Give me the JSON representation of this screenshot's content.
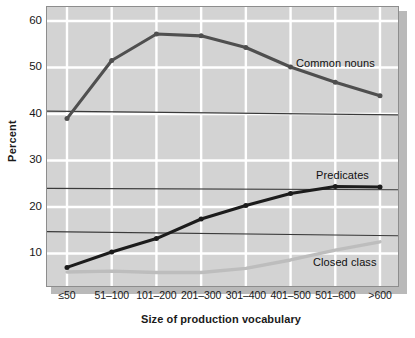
{
  "chart_data": {
    "type": "line",
    "title": "",
    "xlabel": "Size of production vocabulary",
    "ylabel": "Percent",
    "categories": [
      "≤50",
      "51–100",
      "101–200",
      "201–300",
      "301–400",
      "401–500",
      "501–600",
      ">600"
    ],
    "ylim": [
      3,
      63
    ],
    "yticks": [
      10,
      20,
      30,
      40,
      50,
      60
    ],
    "ytick_labels": [
      "10",
      "20",
      "30",
      "40",
      "50",
      "60"
    ],
    "grid": true,
    "legend_position": "inline-annotations",
    "series": [
      {
        "name": "Common nouns",
        "color": "#4f4f4f",
        "markers": true,
        "values": [
          39.0,
          51.5,
          57.2,
          56.8,
          54.3,
          50.1,
          46.8,
          43.9
        ]
      },
      {
        "name": "Predicates",
        "color": "#1c1c1c",
        "markers": true,
        "values": [
          7.0,
          10.3,
          13.2,
          17.4,
          20.3,
          22.9,
          24.4,
          24.3
        ]
      },
      {
        "name": "Closed class",
        "color": "#bdbdbd",
        "markers": false,
        "values": [
          6.0,
          6.2,
          5.9,
          5.9,
          6.8,
          8.6,
          10.7,
          12.5
        ]
      }
    ],
    "reference_lines": [
      {
        "name": "upper-reference-line",
        "y_start": 40.6,
        "y_end": 39.8,
        "color": "#3a3a3a"
      },
      {
        "name": "middle-reference-line",
        "y_start": 24.0,
        "y_end": 23.7,
        "color": "#3a3a3a"
      },
      {
        "name": "lower-reference-line",
        "y_start": 14.7,
        "y_end": 13.8,
        "color": "#3a3a3a"
      }
    ],
    "annotations": [
      {
        "text": "Common nouns",
        "x": 296,
        "y": 57
      },
      {
        "text": "Predicates",
        "x": 316,
        "y": 169
      },
      {
        "text": "Closed class",
        "x": 313,
        "y": 256
      }
    ]
  }
}
